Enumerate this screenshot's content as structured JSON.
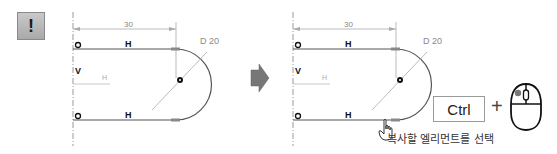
{
  "note_badge": {
    "symbol": "!"
  },
  "left_sketch": {
    "dimension_length": "30",
    "dimension_diameter": "D 20",
    "constraint_top": "H",
    "constraint_bottom": "H",
    "constraint_vertical": "V",
    "axis_label": "H"
  },
  "arrow": {
    "icon": "right-arrow-icon"
  },
  "right_sketch": {
    "dimension_length": "30",
    "dimension_diameter": "D 20",
    "constraint_top": "H",
    "constraint_bottom": "H",
    "constraint_vertical": "V",
    "axis_label": "H"
  },
  "instruction": {
    "key_label": "Ctrl",
    "plus": "+",
    "mouse_icon": "mouse-left-click-icon",
    "cursor_icon": "hand-pointer-icon",
    "caption": "복사할 엘리먼트를 선택"
  },
  "colors": {
    "line": "#555555",
    "dim_line": "#b0b0b0",
    "badge": "#b8b8b8",
    "arrow": "#777777"
  }
}
